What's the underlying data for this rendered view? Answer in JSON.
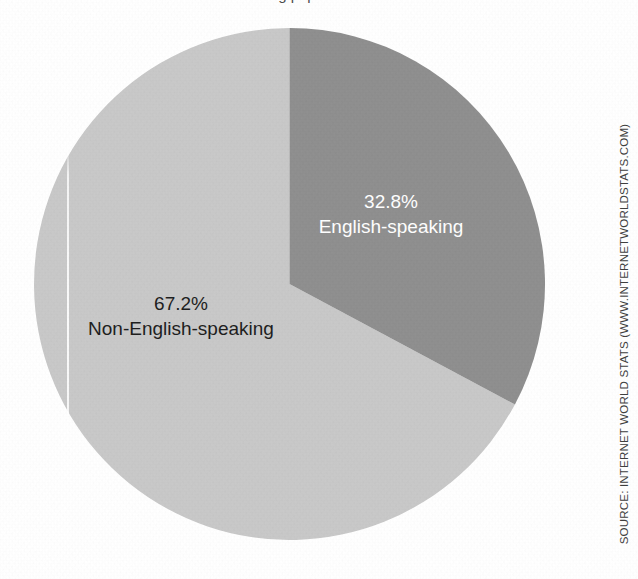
{
  "figure": {
    "cut_off_heading": "…g population…",
    "source_credit": "SOURCE: INTERNET WORLD STATS (WWW.INTERNETWORLDSTATS.COM)"
  },
  "colors": {
    "english_slice": "#8e8e8e",
    "non_english_slice": "#c8c8c8",
    "english_label_text": "#ffffff",
    "non_english_label_text": "#1c1c1c",
    "page_background": "#ffffff"
  },
  "chart_data": {
    "type": "pie",
    "title": "",
    "xlabel": "",
    "ylabel": "",
    "legend_position": "none",
    "grid": false,
    "start_angle_deg": 0,
    "direction": "clockwise",
    "labels": [
      "English-speaking",
      "Non-English-speaking"
    ],
    "values": [
      32.8,
      67.2
    ],
    "value_unit": "%",
    "slices": [
      {
        "label": "English-speaking",
        "percent_text": "32.8%",
        "value": 32.8,
        "color": "#8e8e8e",
        "sweep_deg": 118.1,
        "label_text_color": "#ffffff"
      },
      {
        "label": "Non-English-speaking",
        "percent_text": "67.2%",
        "value": 67.2,
        "color": "#c8c8c8",
        "sweep_deg": 241.9,
        "label_text_color": "#1c1c1c"
      }
    ],
    "annotations": [
      "SOURCE: INTERNET WORLD STATS (WWW.INTERNETWORLDSTATS.COM)"
    ]
  }
}
